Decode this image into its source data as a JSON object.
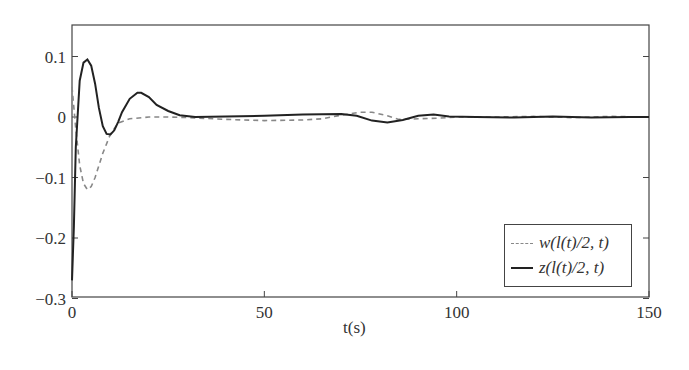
{
  "chart_data": {
    "type": "line",
    "title": "",
    "xlabel": "t(s)",
    "ylabel": "",
    "xlim": [
      0,
      150
    ],
    "ylim": [
      -0.3,
      0.15
    ],
    "xticks": [
      0,
      50,
      100,
      150
    ],
    "yticks": [
      0.1,
      0,
      -0.1,
      -0.2,
      -0.3
    ],
    "xtick_labels": [
      "0",
      "50",
      "100",
      "150"
    ],
    "ytick_labels": [
      "0.1",
      "0",
      "−0.1",
      "−0.2",
      "−0.3"
    ],
    "grid": false,
    "legend_position": "lower right",
    "series": [
      {
        "name": "w(l(t)/2, t)",
        "style": "dashed",
        "color": "#888888",
        "x": [
          0,
          1,
          2,
          3,
          4,
          5,
          6,
          8,
          10,
          12,
          15,
          20,
          25,
          30,
          40,
          50,
          60,
          65,
          70,
          75,
          78,
          82,
          85,
          90,
          95,
          100,
          110,
          120,
          130,
          140,
          150
        ],
        "y": [
          0.05,
          -0.02,
          -0.08,
          -0.11,
          -0.12,
          -0.115,
          -0.1,
          -0.06,
          -0.028,
          -0.01,
          -0.003,
          0.0,
          0.0,
          -0.001,
          -0.004,
          -0.006,
          -0.005,
          -0.003,
          0.003,
          0.008,
          0.008,
          0.002,
          -0.004,
          -0.003,
          -0.002,
          0.0,
          0.0,
          0.001,
          -0.001,
          0.001,
          0.0
        ]
      },
      {
        "name": "z(l(t)/2, t)",
        "style": "solid",
        "color": "#222222",
        "x": [
          0,
          0.5,
          1,
          2,
          3,
          4,
          5,
          6,
          7,
          8,
          9,
          10,
          11,
          12,
          13,
          15,
          17,
          18,
          20,
          22,
          25,
          28,
          32,
          40,
          50,
          60,
          70,
          74,
          78,
          82,
          86,
          90,
          94,
          98,
          105,
          115,
          125,
          135,
          145,
          150
        ],
        "y": [
          -0.27,
          -0.18,
          -0.05,
          0.06,
          0.09,
          0.095,
          0.085,
          0.055,
          0.015,
          -0.015,
          -0.028,
          -0.029,
          -0.022,
          -0.008,
          0.008,
          0.03,
          0.04,
          0.04,
          0.033,
          0.02,
          0.01,
          0.003,
          0.0,
          0.001,
          0.002,
          0.004,
          0.005,
          0.002,
          -0.006,
          -0.009,
          -0.005,
          0.002,
          0.004,
          0.001,
          0.0,
          -0.001,
          0.001,
          -0.001,
          0.0,
          0.0
        ]
      }
    ]
  }
}
